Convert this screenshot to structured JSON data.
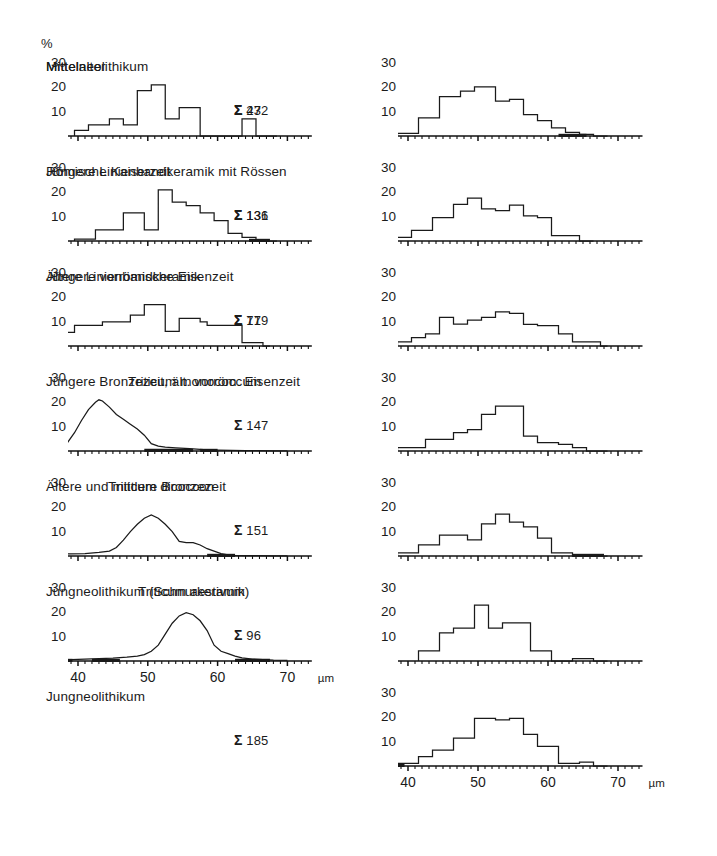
{
  "figure": {
    "y_axis_unit": "%",
    "x_axis_unit": "µm",
    "y_ticks": [
      "30",
      "20",
      "10"
    ],
    "y_tick_values": [
      30,
      20,
      10
    ],
    "x_ticks": [
      "40",
      "50",
      "60",
      "70"
    ],
    "x_tick_values": [
      40,
      50,
      60,
      70
    ],
    "sum_symbol": "Σ",
    "axis_color": "#111111",
    "curve_color": "#1a1a1a",
    "background": "#ffffff"
  },
  "chart_data": [
    {
      "id": "mittelneolithikum",
      "column": "left",
      "index": 0,
      "type": "bar",
      "title": "Mittelneolithikum",
      "count_label": "43",
      "xlabel": "",
      "ylabel": "%",
      "xlim": [
        36.5,
        73.5
      ],
      "ylim": [
        0,
        32
      ],
      "bin_width": 1,
      "x": [
        40,
        41,
        42,
        43,
        44,
        45,
        46,
        47,
        48,
        49,
        50,
        51,
        52,
        53,
        54,
        55,
        56,
        57,
        58,
        59,
        60,
        61,
        62,
        63,
        64,
        65,
        66,
        67,
        68
      ],
      "values": [
        2.3,
        2.3,
        4.6,
        4.6,
        4.6,
        7.0,
        7.0,
        4.6,
        4.6,
        18.6,
        18.6,
        21.0,
        21.0,
        7.0,
        7.0,
        11.6,
        11.6,
        11.6,
        0,
        0,
        0,
        0,
        0,
        0,
        7.0,
        7.0,
        0,
        0,
        0
      ],
      "baseline_bands": []
    },
    {
      "id": "juengere-linienbandkeramik-mit-roessen",
      "column": "left",
      "index": 1,
      "type": "bar",
      "title": "Jüngere Linienbandkeramik mit Rössen",
      "count_label": "131",
      "xlabel": "",
      "ylabel": "%",
      "xlim": [
        36.5,
        73.5
      ],
      "ylim": [
        0,
        32
      ],
      "bin_width": 1,
      "x": [
        40,
        41,
        42,
        43,
        44,
        45,
        46,
        47,
        48,
        49,
        50,
        51,
        52,
        53,
        54,
        55,
        56,
        57,
        58,
        59,
        60,
        61,
        62,
        63,
        64,
        65,
        66,
        67,
        68
      ],
      "values": [
        0.8,
        0.8,
        0.8,
        4.6,
        4.6,
        4.6,
        4.6,
        11.5,
        11.5,
        11.5,
        4.6,
        4.6,
        21.0,
        21.0,
        16.0,
        16.0,
        14.5,
        14.5,
        11.5,
        11.5,
        8.4,
        8.4,
        3.1,
        3.1,
        1.5,
        1.5,
        0,
        0,
        0
      ],
      "baseline_bands": [
        [
          64.5,
          67.5
        ]
      ]
    },
    {
      "id": "aeltere-linienbandkeramik",
      "column": "left",
      "index": 2,
      "type": "bar",
      "title": "Ältere Linienbandkeramik",
      "count_label": "71",
      "xlabel": "",
      "ylabel": "%",
      "xlim": [
        36.5,
        73.5
      ],
      "ylim": [
        0,
        32
      ],
      "bin_width": 1,
      "x": [
        37,
        38,
        39,
        40,
        41,
        42,
        43,
        44,
        45,
        46,
        47,
        48,
        49,
        50,
        51,
        52,
        53,
        54,
        55,
        56,
        57,
        58,
        59,
        60,
        61,
        62,
        63,
        64,
        65,
        66,
        67
      ],
      "values": [
        5.6,
        5.6,
        5.6,
        8.5,
        8.5,
        8.5,
        8.5,
        9.9,
        9.9,
        9.9,
        9.9,
        12.7,
        12.7,
        17.0,
        17.0,
        17.0,
        6.0,
        6.0,
        11.3,
        11.3,
        11.3,
        9.9,
        8.5,
        8.5,
        8.5,
        8.5,
        8.5,
        1.4,
        1.4,
        1.4,
        0
      ],
      "baseline_bands": []
    },
    {
      "id": "triticum-monococcum",
      "column": "left",
      "index": 3,
      "type": "line",
      "title": "Triticum monococcum",
      "count_label": "",
      "xlabel": "",
      "ylabel": "%",
      "xlim": [
        36.5,
        73.5
      ],
      "ylim": [
        0,
        32
      ],
      "x": [
        37.5,
        38.5,
        39.5,
        40.5,
        41.5,
        42.5,
        43.0,
        43.5,
        44.5,
        45.5,
        46.5,
        47.5,
        48.5,
        49.5,
        50.5,
        51.5,
        52.5,
        54,
        56,
        58,
        60,
        62,
        64,
        66,
        68,
        70
      ],
      "values": [
        1.5,
        3.5,
        7.5,
        12.5,
        17.0,
        20.0,
        21.0,
        20.5,
        18.0,
        15.0,
        13.0,
        11.0,
        9.0,
        6.5,
        3.0,
        2.0,
        1.6,
        1.3,
        1.0,
        0.6,
        0.4,
        0.3,
        0.2,
        0.2,
        0.1,
        0.1
      ],
      "baseline_bands": [
        [
          49.5,
          56.5
        ],
        [
          57.5,
          60.0
        ]
      ]
    },
    {
      "id": "triticum-dicoccon",
      "column": "left",
      "index": 4,
      "type": "line",
      "title": "Triticum dicoccon",
      "count_label": "",
      "xlabel": "",
      "ylabel": "%",
      "xlim": [
        36.5,
        73.5
      ],
      "ylim": [
        0,
        32
      ],
      "x": [
        37.5,
        39,
        41,
        43,
        44.5,
        45.5,
        46.5,
        47.5,
        48.5,
        49.5,
        50.5,
        51.5,
        52.5,
        53.5,
        54.5,
        55.5,
        56.5,
        57.5,
        58.5,
        59.5,
        60.5,
        61.5,
        62.5,
        64,
        66,
        68,
        70
      ],
      "values": [
        0.7,
        0.9,
        1.0,
        1.5,
        2.0,
        3.5,
        6.5,
        10.0,
        13.0,
        15.5,
        16.8,
        15.5,
        13.0,
        10.0,
        6.0,
        5.5,
        5.5,
        4.5,
        3.0,
        2.0,
        1.0,
        0.5,
        0.3,
        0.2,
        0.2,
        0.1,
        0.1
      ],
      "baseline_bands": [
        [
          37.0,
          38.0
        ],
        [
          58.5,
          62.5
        ]
      ]
    },
    {
      "id": "triticum-aestivum",
      "column": "left",
      "index": 5,
      "type": "line",
      "title": "Triticum aestivum",
      "count_label": "",
      "xlabel": "",
      "ylabel": "%",
      "xlim": [
        36.5,
        73.5
      ],
      "ylim": [
        0,
        32
      ],
      "x": [
        37.5,
        39,
        41,
        43,
        45,
        47,
        48.5,
        49.5,
        50.5,
        51.5,
        52.5,
        53.5,
        54.5,
        55.5,
        56.5,
        57.5,
        58.5,
        59.5,
        60.5,
        61.5,
        62.5,
        63.5,
        65,
        66.5,
        68,
        70
      ],
      "values": [
        0.6,
        0.6,
        0.8,
        1.0,
        1.2,
        1.6,
        2.0,
        2.6,
        4.0,
        6.5,
        11.0,
        15.5,
        18.5,
        19.8,
        19.0,
        16.5,
        12.5,
        6.5,
        4.0,
        3.0,
        2.0,
        1.3,
        0.8,
        0.6,
        0.4,
        0.3
      ],
      "baseline_bands": [
        [
          37.8,
          39.2
        ],
        [
          42.0,
          46.0
        ],
        [
          62.5,
          67.5
        ]
      ]
    },
    {
      "id": "mittelalter",
      "column": "right",
      "index": 0,
      "type": "bar",
      "title": "Mittelalter",
      "count_label": "272",
      "xlabel": "",
      "ylabel": "%",
      "xlim": [
        36.5,
        73.5
      ],
      "ylim": [
        0,
        32
      ],
      "bin_width": 1,
      "x": [
        39,
        40,
        41,
        42,
        43,
        44,
        45,
        46,
        47,
        48,
        49,
        50,
        51,
        52,
        53,
        54,
        55,
        56,
        57,
        58,
        59,
        60,
        61,
        62,
        63,
        64,
        65,
        66,
        67,
        68
      ],
      "values": [
        1.1,
        1.1,
        1.1,
        7.4,
        7.4,
        7.4,
        16.2,
        16.2,
        16.2,
        18.4,
        18.4,
        20.2,
        20.2,
        20.2,
        14.3,
        14.3,
        15.0,
        15.0,
        8.8,
        8.8,
        6.3,
        6.3,
        3.3,
        3.3,
        1.5,
        1.5,
        0.7,
        0.7,
        0,
        0
      ],
      "baseline_bands": [
        [
          61.5,
          65.5
        ]
      ]
    },
    {
      "id": "roemische-kaiserzeit",
      "column": "right",
      "index": 1,
      "type": "bar",
      "title": "Römische Kaiserzeit",
      "count_label": "136",
      "xlabel": "",
      "ylabel": "%",
      "xlim": [
        36.5,
        73.5
      ],
      "ylim": [
        0,
        32
      ],
      "bin_width": 1,
      "x": [
        37,
        38,
        39,
        40,
        41,
        42,
        43,
        44,
        45,
        46,
        47,
        48,
        49,
        50,
        51,
        52,
        53,
        54,
        55,
        56,
        57,
        58,
        59,
        60,
        61,
        62,
        63,
        64,
        65,
        66
      ],
      "values": [
        1.5,
        1.5,
        1.5,
        1.5,
        4.4,
        4.4,
        4.4,
        9.6,
        9.6,
        9.6,
        15.0,
        15.0,
        17.6,
        17.6,
        13.2,
        13.2,
        12.5,
        12.5,
        14.7,
        14.7,
        10.3,
        10.3,
        9.6,
        9.6,
        2.2,
        2.2,
        2.2,
        2.2,
        0,
        0
      ],
      "baseline_bands": []
    },
    {
      "id": "juengere-vorroemische-eisenzeit",
      "column": "right",
      "index": 2,
      "type": "bar",
      "title": "Jüngere vorrömische Eisenzeit",
      "count_label": "179",
      "xlabel": "",
      "ylabel": "%",
      "xlim": [
        36.5,
        73.5
      ],
      "ylim": [
        0,
        32
      ],
      "bin_width": 1,
      "x": [
        39,
        40,
        41,
        42,
        43,
        44,
        45,
        46,
        47,
        48,
        49,
        50,
        51,
        52,
        53,
        54,
        55,
        56,
        57,
        58,
        59,
        60,
        61,
        62,
        63,
        64,
        65,
        66,
        67,
        68
      ],
      "values": [
        1.7,
        1.7,
        3.4,
        3.4,
        5.0,
        5.0,
        11.7,
        11.7,
        9.0,
        9.0,
        10.6,
        10.6,
        11.7,
        11.7,
        14.0,
        14.0,
        13.4,
        13.4,
        8.9,
        8.9,
        8.4,
        8.4,
        8.4,
        5.0,
        5.0,
        1.7,
        1.7,
        1.7,
        1.7,
        0
      ],
      "baseline_bands": []
    },
    {
      "id": "juengere-bronzezeit-aelt-vorroem-eisenzeit",
      "column": "right",
      "index": 3,
      "type": "bar",
      "title": "Jüngere Bronzezeit, ält. vorröm. Eisenzeit",
      "count_label": "147",
      "xlabel": "",
      "ylabel": "%",
      "xlim": [
        36.5,
        73.5
      ],
      "ylim": [
        0,
        32
      ],
      "bin_width": 1,
      "x": [
        39,
        40,
        41,
        42,
        43,
        44,
        45,
        46,
        47,
        48,
        49,
        50,
        51,
        52,
        53,
        54,
        55,
        56,
        57,
        58,
        59,
        60,
        61,
        62,
        63,
        64,
        65,
        66,
        67,
        68
      ],
      "values": [
        1.4,
        1.4,
        1.4,
        1.4,
        4.8,
        4.8,
        4.8,
        4.8,
        7.5,
        7.5,
        8.8,
        8.8,
        15.0,
        15.0,
        18.4,
        18.4,
        18.4,
        18.4,
        6.1,
        6.1,
        3.4,
        3.4,
        3.4,
        2.7,
        2.7,
        1.4,
        1.4,
        0,
        0,
        0
      ],
      "baseline_bands": []
    },
    {
      "id": "aeltere-und-mittlere-bronzezeit",
      "column": "right",
      "index": 4,
      "type": "bar",
      "title": "Ältere und mittlere Bronzezeit",
      "count_label": "151",
      "xlabel": "",
      "ylabel": "%",
      "xlim": [
        36.5,
        73.5
      ],
      "ylim": [
        0,
        32
      ],
      "bin_width": 1,
      "x": [
        39,
        40,
        41,
        42,
        43,
        44,
        45,
        46,
        47,
        48,
        49,
        50,
        51,
        52,
        53,
        54,
        55,
        56,
        57,
        58,
        59,
        60,
        61,
        62,
        63,
        64,
        65,
        66,
        67,
        68
      ],
      "values": [
        1.3,
        1.3,
        1.3,
        4.6,
        4.6,
        4.6,
        8.6,
        8.6,
        8.6,
        8.6,
        6.6,
        6.6,
        13.2,
        13.2,
        17.2,
        17.2,
        13.9,
        13.9,
        11.9,
        11.9,
        7.3,
        7.3,
        1.3,
        1.3,
        1.3,
        0,
        0,
        0,
        0,
        0
      ],
      "baseline_bands": [
        [
          63.5,
          68.0
        ]
      ]
    },
    {
      "id": "jungneolithikum-schnurkeramik",
      "column": "right",
      "index": 5,
      "type": "bar",
      "title": "Jungneolithikum (Schnurkeramik)",
      "count_label": "96",
      "xlabel": "",
      "ylabel": "%",
      "xlim": [
        36.5,
        73.5
      ],
      "ylim": [
        0,
        32
      ],
      "bin_width": 1,
      "x": [
        42,
        43,
        44,
        45,
        46,
        47,
        48,
        49,
        50,
        51,
        52,
        53,
        54,
        55,
        56,
        57,
        58,
        59,
        60,
        61,
        62,
        63,
        64,
        65,
        66,
        67,
        68
      ],
      "values": [
        4.2,
        4.2,
        4.2,
        11.5,
        11.5,
        13.5,
        13.5,
        13.5,
        22.9,
        22.9,
        13.5,
        13.5,
        15.6,
        15.6,
        15.6,
        15.6,
        4.2,
        4.2,
        4.2,
        0,
        0,
        0,
        1.0,
        1.0,
        1.0,
        0,
        0
      ],
      "baseline_bands": []
    },
    {
      "id": "jungneolithikum",
      "column": "right",
      "index": 6,
      "type": "bar",
      "title": "Jungneolithikum",
      "count_label": "185",
      "xlabel": "",
      "ylabel": "%",
      "xlim": [
        36.5,
        73.5
      ],
      "ylim": [
        0,
        32
      ],
      "bin_width": 1,
      "x": [
        39,
        40,
        41,
        42,
        43,
        44,
        45,
        46,
        47,
        48,
        49,
        50,
        51,
        52,
        53,
        54,
        55,
        56,
        57,
        58,
        59,
        60,
        61,
        62,
        63,
        64,
        65,
        66,
        67,
        68
      ],
      "values": [
        1.1,
        1.1,
        1.1,
        3.8,
        3.8,
        6.5,
        6.5,
        6.5,
        11.4,
        11.4,
        11.4,
        19.5,
        19.5,
        19.5,
        18.9,
        18.9,
        19.5,
        19.5,
        13.0,
        13.0,
        8.1,
        8.1,
        8.1,
        1.1,
        1.1,
        1.1,
        1.6,
        1.6,
        0,
        0
      ],
      "baseline_bands": [
        [
          38.0,
          39.5
        ]
      ]
    }
  ]
}
